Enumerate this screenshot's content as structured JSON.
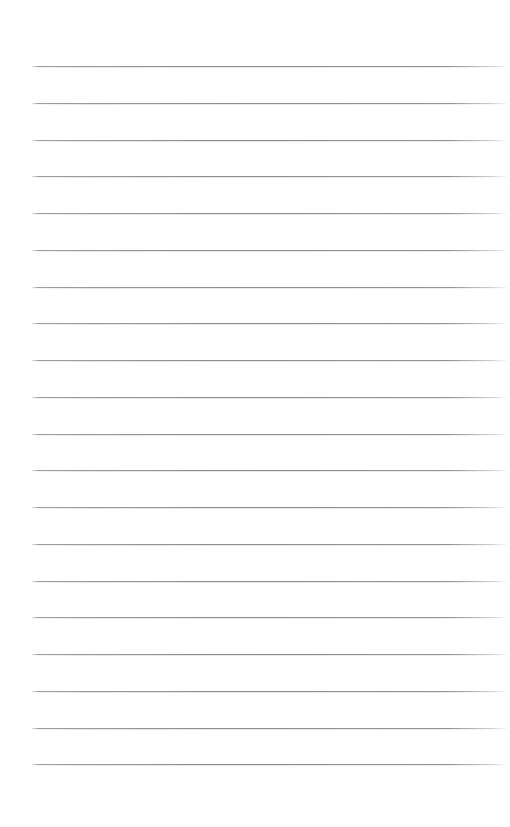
{
  "page": {
    "kind": "lined-paper",
    "width": 510,
    "height": 827,
    "background_color": "#ffffff",
    "content_text": "",
    "has_text_content": false
  },
  "ruling": {
    "line_count": 20,
    "line_color": "#9e9e9e",
    "line_thickness_px": 1,
    "line_left_px": 32,
    "line_right_px": 506,
    "line_width_px": 474,
    "first_line_y_px": 66,
    "last_line_y_px": 764,
    "line_spacing_px": 36.75,
    "top_margin_px": 66,
    "bottom_margin_px": 63,
    "left_margin_px": 32,
    "right_margin_px": 4,
    "margin_rule": false,
    "line_y_positions": [
      66,
      103,
      140,
      176,
      213,
      250,
      287,
      323,
      360,
      397,
      434,
      470,
      507,
      544,
      581,
      617,
      654,
      691,
      728,
      764
    ]
  },
  "write_slots": [
    {
      "index": 1,
      "value": "",
      "placeholder": ""
    },
    {
      "index": 2,
      "value": "",
      "placeholder": ""
    },
    {
      "index": 3,
      "value": "",
      "placeholder": ""
    },
    {
      "index": 4,
      "value": "",
      "placeholder": ""
    },
    {
      "index": 5,
      "value": "",
      "placeholder": ""
    },
    {
      "index": 6,
      "value": "",
      "placeholder": ""
    },
    {
      "index": 7,
      "value": "",
      "placeholder": ""
    },
    {
      "index": 8,
      "value": "",
      "placeholder": ""
    },
    {
      "index": 9,
      "value": "",
      "placeholder": ""
    },
    {
      "index": 10,
      "value": "",
      "placeholder": ""
    },
    {
      "index": 11,
      "value": "",
      "placeholder": ""
    },
    {
      "index": 12,
      "value": "",
      "placeholder": ""
    },
    {
      "index": 13,
      "value": "",
      "placeholder": ""
    },
    {
      "index": 14,
      "value": "",
      "placeholder": ""
    },
    {
      "index": 15,
      "value": "",
      "placeholder": ""
    },
    {
      "index": 16,
      "value": "",
      "placeholder": ""
    },
    {
      "index": 17,
      "value": "",
      "placeholder": ""
    },
    {
      "index": 18,
      "value": "",
      "placeholder": ""
    },
    {
      "index": 19,
      "value": "",
      "placeholder": ""
    },
    {
      "index": 20,
      "value": "",
      "placeholder": ""
    }
  ]
}
